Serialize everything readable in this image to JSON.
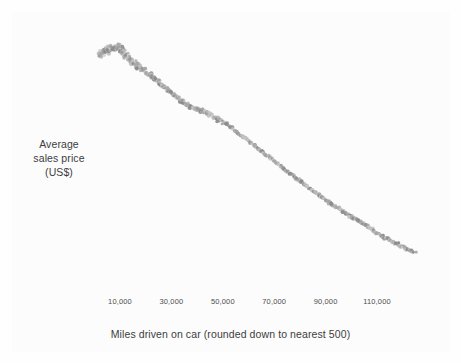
{
  "chart_data": {
    "type": "scatter",
    "title": "",
    "xlabel": "Miles driven on car (rounded down to nearest 500)",
    "ylabel": "Average sales price (US$)",
    "ylabel_lines": [
      "Average",
      "sales price",
      "(US$)"
    ],
    "grid": false,
    "legend": null,
    "xlim": [
      0,
      130000
    ],
    "xticks": [
      10000,
      30000,
      50000,
      70000,
      90000,
      110000
    ],
    "xtick_labels": [
      "10,000",
      "30,000",
      "50,000",
      "70,000",
      "90,000",
      "110,000"
    ],
    "yticks": [],
    "ytick_labels": [],
    "ylim_note": "y axis has no tick marks or numeric labels in the figure",
    "point_color": "#a8a8a8",
    "point_color_dark": "#8c8c8c",
    "point_color_light": "#c4c4c4",
    "point_radius_px": 1.6,
    "background_color": "#fcfcfc",
    "text_color": "#3c3c3c",
    "tick_text_color": "#4d4d4d",
    "series": [
      {
        "name": "Average sales price by mileage",
        "x": [
          2000,
          2500,
          3000,
          3500,
          4000,
          4500,
          5000,
          5500,
          6000,
          6500,
          7000,
          7500,
          8000,
          8500,
          9000,
          9500,
          10000,
          10500,
          11000,
          11500,
          12000,
          12500,
          13000,
          13500,
          14000,
          14500,
          15000,
          15500,
          16000,
          16500,
          17000,
          17500,
          18000,
          18500,
          19000,
          19500,
          20000,
          20500,
          21000,
          21500,
          22000,
          22500,
          23000,
          23500,
          24000,
          24500,
          25000,
          25500,
          26000,
          26500,
          27000,
          27500,
          28000,
          28500,
          29000,
          29500,
          30000,
          30500,
          31000,
          31500,
          32000,
          32500,
          33000,
          33500,
          34000,
          34500,
          35000,
          35500,
          36000,
          36500,
          37000,
          37500,
          38000,
          38500,
          39000,
          39500,
          40000,
          40500,
          41000,
          41500,
          42000,
          42500,
          43000,
          43500,
          44000,
          44500,
          45000,
          45500,
          46000,
          46500,
          47000,
          47500,
          48000,
          48500,
          49000,
          49500,
          50000,
          50500,
          51000,
          51500,
          52000,
          52500,
          53000,
          53500,
          54000,
          54500,
          55000,
          55500,
          56000,
          56500,
          57000,
          57500,
          58000,
          58500,
          59000,
          59500,
          60000,
          60500,
          61000,
          61500,
          62000,
          62500,
          63000,
          63500,
          64000,
          64500,
          65000,
          65500,
          66000,
          66500,
          67000,
          67500,
          68000,
          68500,
          69000,
          69500,
          70000,
          70500,
          71000,
          71500,
          72000,
          72500,
          73000,
          73500,
          74000,
          74500,
          75000,
          75500,
          76000,
          76500,
          77000,
          77500,
          78000,
          78500,
          79000,
          79500,
          80000,
          80500,
          81000,
          81500,
          82000,
          82500,
          83000,
          83500,
          84000,
          84500,
          85000,
          85500,
          86000,
          86500,
          87000,
          87500,
          88000,
          88500,
          89000,
          89500,
          90000,
          90500,
          91000,
          91500,
          92000,
          92500,
          93000,
          93500,
          94000,
          94500,
          95000,
          95500,
          96000,
          96500,
          97000,
          97500,
          98000,
          98500,
          99000,
          99500,
          100000,
          100500,
          101000,
          101500,
          102000,
          102500,
          103000,
          103500,
          104000,
          104500,
          105000,
          105500,
          106000,
          106500,
          107000,
          107500,
          108000,
          108500,
          109000,
          109500,
          110000,
          110500,
          111000,
          111500,
          112000,
          112500,
          113000,
          113500,
          114000,
          114500,
          115000,
          115500,
          116000,
          116500,
          117000,
          117500,
          118000,
          118500,
          119000,
          119500,
          120000,
          120500,
          121000,
          121500,
          122000,
          122500,
          123000,
          123500,
          124000,
          124500,
          125000
        ],
        "y_pixel": [
          56,
          55,
          53,
          52,
          51,
          50,
          52,
          50,
          49,
          48,
          48,
          49,
          48,
          47,
          48,
          47,
          49,
          50,
          51,
          52,
          54,
          56,
          58,
          59,
          60,
          62,
          62,
          63,
          64,
          65,
          66,
          67,
          68,
          69,
          69,
          70,
          71,
          73,
          74,
          75,
          75,
          77,
          78,
          79,
          80,
          81,
          82,
          83,
          85,
          86,
          87,
          88,
          89,
          90,
          91,
          92,
          93,
          94,
          95,
          96,
          97,
          98,
          99,
          100,
          101,
          102,
          103,
          104,
          104,
          105,
          106,
          107,
          107,
          108,
          108,
          109,
          109,
          110,
          110,
          111,
          111,
          112,
          112,
          113,
          113,
          114,
          115,
          116,
          117,
          118,
          119,
          120,
          119,
          120,
          121,
          122,
          123,
          123,
          124,
          124,
          125,
          126,
          127,
          128,
          129,
          130,
          131,
          132,
          133,
          134,
          135,
          136,
          137,
          138,
          139,
          140,
          141,
          142,
          143,
          144,
          145,
          146,
          147,
          148,
          149,
          150,
          151,
          152,
          153,
          154,
          155,
          156,
          157,
          158,
          159,
          160,
          161,
          162,
          163,
          164,
          165,
          166,
          167,
          168,
          169,
          170,
          171,
          172,
          173,
          174,
          175,
          176,
          177,
          178,
          179,
          180,
          181,
          182,
          183,
          184,
          185,
          186,
          187,
          188,
          189,
          190,
          191,
          192,
          192,
          193,
          194,
          195,
          196,
          197,
          198,
          199,
          200,
          201,
          202,
          203,
          204,
          204,
          205,
          206,
          207,
          208,
          208,
          209,
          210,
          211,
          212,
          213,
          213,
          214,
          215,
          216,
          216,
          217,
          218,
          219,
          219,
          220,
          221,
          222,
          222,
          223,
          224,
          225,
          226,
          227,
          228,
          229,
          229,
          230,
          231,
          232,
          233,
          234,
          235,
          235,
          236,
          237,
          238,
          238,
          239,
          240,
          240,
          241,
          242,
          242,
          243,
          244,
          244,
          245,
          246,
          246,
          247,
          248,
          248,
          249,
          250,
          250,
          251,
          251,
          252,
          252,
          253
        ]
      }
    ]
  },
  "axes": {
    "x_title": "Miles driven on car (rounded down to nearest 500)",
    "y_title_lines": [
      "Average",
      "sales price",
      "(US$)"
    ],
    "x_tick_labels": [
      "10,000",
      "30,000",
      "50,000",
      "70,000",
      "90,000",
      "110,000"
    ]
  }
}
